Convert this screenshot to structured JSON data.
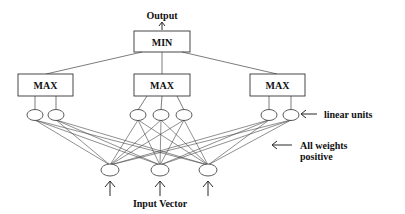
{
  "labels": {
    "output": "Output",
    "min": "MIN",
    "max": "MAX",
    "linear_units": "linear units",
    "weights_line1": "All weights",
    "weights_line2": "positive",
    "input_vector": "Input Vector"
  },
  "structure": {
    "min_node": {
      "label": "MIN",
      "inputs_from": [
        "max-1",
        "max-2",
        "max-3"
      ]
    },
    "max_nodes": [
      {
        "id": "max-1",
        "label": "MAX",
        "linear_units": 2
      },
      {
        "id": "max-2",
        "label": "MAX",
        "linear_units": 3
      },
      {
        "id": "max-3",
        "label": "MAX",
        "linear_units": 2
      }
    ],
    "input_nodes": 3,
    "connectivity": "every linear unit connected to every input node"
  }
}
